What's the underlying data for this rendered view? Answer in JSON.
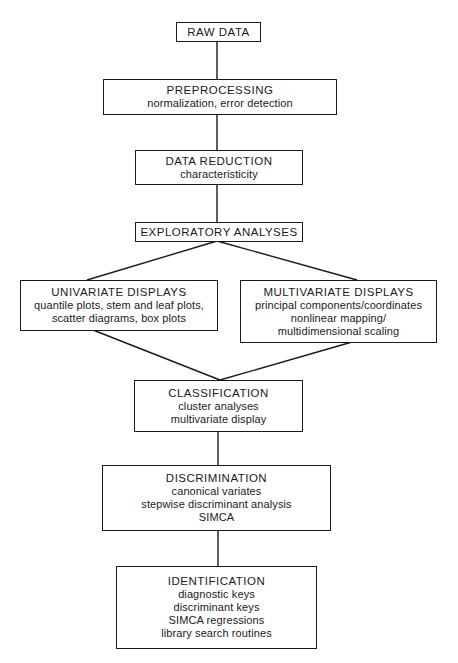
{
  "diagram": {
    "type": "flowchart",
    "colors": {
      "stroke": "#1a1a1a",
      "background": "#ffffff",
      "text": "#1a1a1a"
    },
    "nodes": [
      {
        "id": "raw-data",
        "title": "RAW DATA",
        "lines": []
      },
      {
        "id": "preprocessing",
        "title": "PREPROCESSING",
        "lines": [
          "normalization, error detection"
        ]
      },
      {
        "id": "data-reduction",
        "title": "DATA REDUCTION",
        "lines": [
          "characteristicity"
        ]
      },
      {
        "id": "exploratory-analyses",
        "title": "EXPLORATORY ANALYSES",
        "lines": []
      },
      {
        "id": "univariate-displays",
        "title": "UNIVARIATE DISPLAYS",
        "lines": [
          "quantile plots, stem and leaf plots,",
          "scatter diagrams, box plots"
        ]
      },
      {
        "id": "multivariate-displays",
        "title": "MULTIVARIATE DISPLAYS",
        "lines": [
          "principal components/coordinates",
          "nonlinear mapping/",
          "multidimensional scaling"
        ]
      },
      {
        "id": "classification",
        "title": "CLASSIFICATION",
        "lines": [
          "cluster analyses",
          "multivariate display"
        ]
      },
      {
        "id": "discrimination",
        "title": "DISCRIMINATION",
        "lines": [
          "canonical variates",
          "stepwise discriminant analysis",
          "SIMCA"
        ]
      },
      {
        "id": "identification",
        "title": "IDENTIFICATION",
        "lines": [
          "diagnostic keys",
          "discriminant keys",
          "SIMCA regressions",
          "library search routines"
        ]
      }
    ],
    "edges": [
      {
        "from": "raw-data",
        "to": "preprocessing"
      },
      {
        "from": "preprocessing",
        "to": "data-reduction"
      },
      {
        "from": "data-reduction",
        "to": "exploratory-analyses"
      },
      {
        "from": "exploratory-analyses",
        "to": "univariate-displays"
      },
      {
        "from": "exploratory-analyses",
        "to": "multivariate-displays"
      },
      {
        "from": "univariate-displays",
        "to": "classification"
      },
      {
        "from": "multivariate-displays",
        "to": "classification"
      },
      {
        "from": "classification",
        "to": "discrimination"
      },
      {
        "from": "discrimination",
        "to": "identification"
      }
    ]
  }
}
